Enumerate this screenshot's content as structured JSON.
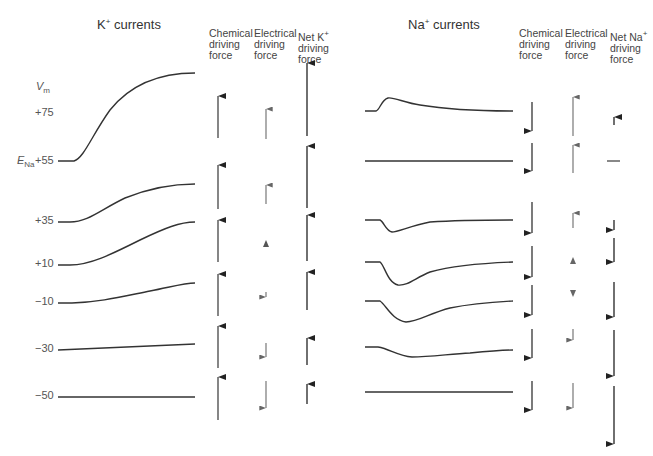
{
  "left_panel": {
    "title_ion": "K",
    "title_charge": "+",
    "title_suffix": " currents",
    "col_chemical": [
      "Chemical",
      "driving",
      "force"
    ],
    "col_electrical": [
      "Electrical",
      "driving",
      "force"
    ],
    "col_net": [
      "Net K",
      "driving",
      "force"
    ],
    "col_net_charge": "+"
  },
  "right_panel": {
    "title_ion": "Na",
    "title_charge": "+",
    "title_suffix": " currents",
    "col_chemical": [
      "Chemical",
      "driving",
      "force"
    ],
    "col_electrical": [
      "Electrical",
      "driving",
      "force"
    ],
    "col_net": [
      "Net Na",
      "driving",
      "force"
    ],
    "col_net_charge": "+"
  },
  "axis": {
    "vm_label": "V",
    "vm_sub": "m",
    "ena_label": "E",
    "ena_sub": "Na"
  },
  "voltages": [
    "+75",
    "+55",
    "+35",
    "+10",
    "−10",
    "−30",
    "−50"
  ],
  "colors": {
    "trace": "#333333",
    "arrow_dark": "#222222",
    "arrow_gray": "#777777",
    "label": "#555555"
  }
}
